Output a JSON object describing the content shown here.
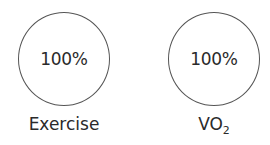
{
  "nodes": [
    {
      "value": "100%",
      "label": "Exercise",
      "label_sub": ""
    },
    {
      "value": "100%",
      "label": "VO",
      "label_sub": "2"
    }
  ]
}
